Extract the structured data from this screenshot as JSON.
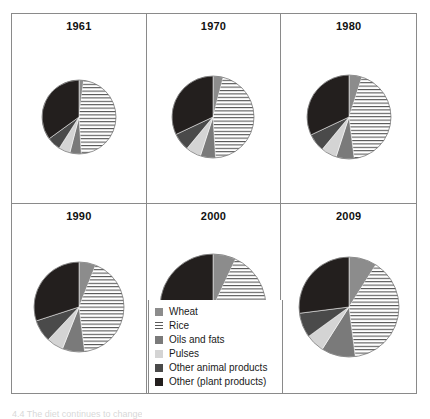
{
  "figure": {
    "caption_partial": "4.4  The diet continues to change"
  },
  "legend": {
    "position": "bottom-center",
    "items": [
      {
        "label": "Wheat",
        "swatch": "wheat-swatch",
        "color": "#8c8c8c",
        "pattern": "solid"
      },
      {
        "label": "Rice",
        "swatch": "rice-swatch",
        "color": "#5a5a5a",
        "pattern": "horizontal-lines"
      },
      {
        "label": "Oils and fats",
        "swatch": "oils-and-fats-swatch",
        "color": "#7a7a7a",
        "pattern": "solid"
      },
      {
        "label": "Pulses",
        "swatch": "pulses-swatch",
        "color": "#d4d4d4",
        "pattern": "solid"
      },
      {
        "label": "Other animal products",
        "swatch": "other-animal-products-swatch",
        "color": "#4a4a4a",
        "pattern": "solid"
      },
      {
        "label": "Other (plant products)",
        "swatch": "other-plant-products-swatch",
        "color": "#231f1e",
        "pattern": "solid"
      }
    ]
  },
  "panels": [
    {
      "year": "1961",
      "radius": 37
    },
    {
      "year": "1970",
      "radius": 41
    },
    {
      "year": "1980",
      "radius": 42
    },
    {
      "year": "1990",
      "radius": 45
    },
    {
      "year": "2000",
      "radius": 53
    },
    {
      "year": "2009",
      "radius": 50
    }
  ],
  "chart_data": {
    "type": "pie",
    "categories": [
      "Wheat",
      "Rice",
      "Oils and fats",
      "Pulses",
      "Other animal products",
      "Other (plant products)"
    ],
    "colors": [
      "#8c8c8c",
      "#ffffff",
      "#7a7a7a",
      "#d4d4d4",
      "#4a4a4a",
      "#231f1e"
    ],
    "patterns": [
      "solid",
      "horizontal-lines",
      "solid",
      "solid",
      "solid",
      "solid"
    ],
    "units": "percent",
    "note": "Slices ordered clockwise from 12 o'clock; pie diameter grows with total dietary energy supply.",
    "series": [
      {
        "name": "1961",
        "radius_px": 37,
        "values": [
          2,
          47,
          5,
          5,
          6,
          35
        ]
      },
      {
        "name": "1970",
        "radius_px": 41,
        "values": [
          4,
          45,
          6,
          6,
          7,
          32
        ]
      },
      {
        "name": "1980",
        "radius_px": 42,
        "values": [
          5,
          43,
          7,
          6,
          7,
          32
        ]
      },
      {
        "name": "1990",
        "radius_px": 45,
        "values": [
          6,
          42,
          8,
          6,
          8,
          30
        ]
      },
      {
        "name": "2000",
        "radius_px": 53,
        "values": [
          7,
          41,
          9,
          6,
          8,
          29
        ]
      },
      {
        "name": "2009",
        "radius_px": 50,
        "values": [
          9,
          39,
          11,
          6,
          8,
          27
        ]
      }
    ]
  }
}
